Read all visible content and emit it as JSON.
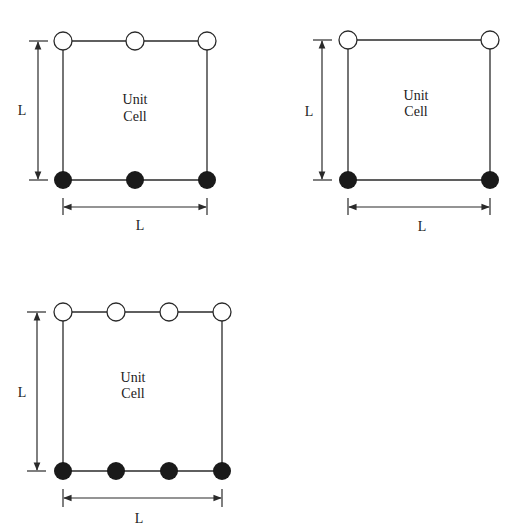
{
  "diagrams": [
    {
      "id": "cell-3-per-side",
      "title_line1": "Unit",
      "title_line2": "Cell",
      "height_label": "L",
      "width_label": "L",
      "nodes_per_side": 3,
      "top_nodes": "open",
      "bottom_nodes": "filled"
    },
    {
      "id": "cell-2-per-side",
      "title_line1": "Unit",
      "title_line2": "Cell",
      "height_label": "L",
      "width_label": "L",
      "nodes_per_side": 2,
      "top_nodes": "open",
      "bottom_nodes": "filled"
    },
    {
      "id": "cell-4-per-side",
      "title_line1": "Unit",
      "title_line2": "Cell",
      "height_label": "L",
      "width_label": "L",
      "nodes_per_side": 4,
      "top_nodes": "open",
      "bottom_nodes": "filled"
    }
  ],
  "colors": {
    "line": "#2a2a2a",
    "filled_node": "#1a1a1a",
    "open_node": "#ffffff"
  }
}
